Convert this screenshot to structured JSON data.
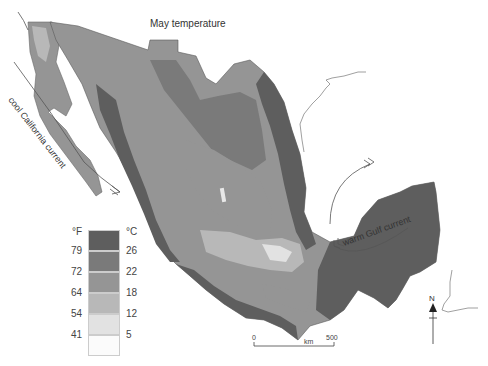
{
  "title": "May temperature",
  "legend": {
    "unit_f": "°F",
    "unit_c": "°C",
    "classes": [
      {
        "label_f": "",
        "label_c": "",
        "range_c": ">26",
        "color": "#5e5e5e"
      },
      {
        "label_f": "79",
        "label_c": "26",
        "range_c": "22-26",
        "color": "#7a7a7a"
      },
      {
        "label_f": "72",
        "label_c": "22",
        "range_c": "18-22",
        "color": "#959595"
      },
      {
        "label_f": "64",
        "label_c": "18",
        "range_c": "12-18",
        "color": "#b8b8b8"
      },
      {
        "label_f": "54",
        "label_c": "12",
        "range_c": "5-12",
        "color": "#e2e2e2"
      },
      {
        "label_f": "41",
        "label_c": "5",
        "range_c": "<5",
        "color": "#fbfbfb"
      }
    ]
  },
  "annotations": {
    "california_current": "cool California current",
    "gulf_current": "warm Gulf current"
  },
  "scale_bar": {
    "start": "0",
    "unit": "km",
    "end": "500"
  },
  "north_label": "N"
}
